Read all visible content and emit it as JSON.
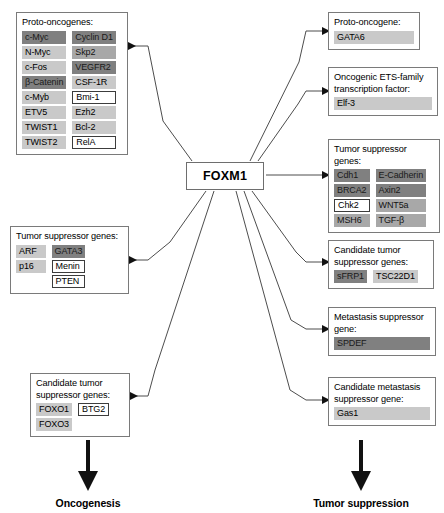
{
  "center": {
    "label": "FOXM1"
  },
  "left_panels": [
    {
      "id": "proto-oncogenes",
      "title": "Proto-oncogenes:",
      "columns": [
        [
          {
            "label": "c-Myc",
            "shade": "dark"
          },
          {
            "label": "N-Myc",
            "shade": "light"
          },
          {
            "label": "c-Fos",
            "shade": "light"
          },
          {
            "label": "β-Catenin",
            "shade": "dark"
          },
          {
            "label": "c-Myb",
            "shade": "light"
          },
          {
            "label": "ETV5",
            "shade": "light"
          },
          {
            "label": "TWIST1",
            "shade": "light"
          },
          {
            "label": "TWIST2",
            "shade": "light"
          }
        ],
        [
          {
            "label": "Cyclin D1",
            "shade": "dark"
          },
          {
            "label": "Skp2",
            "shade": "mid"
          },
          {
            "label": "VEGFR2",
            "shade": "dark"
          },
          {
            "label": "CSF-1R",
            "shade": "light"
          },
          {
            "label": "Bmi-1",
            "shade": "box"
          },
          {
            "label": "Ezh2",
            "shade": "light"
          },
          {
            "label": "Bcl-2",
            "shade": "light"
          },
          {
            "label": "RelA",
            "shade": "box"
          }
        ]
      ]
    },
    {
      "id": "tumor-suppressor-genes-left",
      "title": "Tumor suppressor genes:",
      "columns": [
        [
          {
            "label": "ARF",
            "shade": "light"
          },
          {
            "label": "p16",
            "shade": "light"
          },
          {
            "label": "",
            "shade": "spacer"
          }
        ],
        [
          {
            "label": "GATA3",
            "shade": "dark"
          },
          {
            "label": "Menin",
            "shade": "box"
          },
          {
            "label": "PTEN",
            "shade": "box"
          }
        ]
      ]
    },
    {
      "id": "candidate-tumor-suppressor-genes",
      "title": "Candidate tumor\nsuppressor genes:",
      "columns": [
        [
          {
            "label": "FOXO1",
            "shade": "light"
          },
          {
            "label": "FOXO3",
            "shade": "light"
          }
        ],
        [
          {
            "label": "BTG2",
            "shade": "box"
          }
        ]
      ]
    }
  ],
  "right_panels": [
    {
      "id": "proto-oncogene",
      "title": "Proto-oncogene:",
      "columns": [
        [
          {
            "label": "GATA6",
            "shade": "light"
          }
        ]
      ]
    },
    {
      "id": "oncogenic-ets-family-transcription-factor",
      "title": "Oncogenic ETS-family\ntranscription factor:",
      "columns": [
        [
          {
            "label": "Elf-3",
            "shade": "light"
          }
        ]
      ]
    },
    {
      "id": "tumor-suppressor-genes-right",
      "title": "Tumor suppressor genes:",
      "columns": [
        [
          {
            "label": "Cdh1",
            "shade": "dark"
          },
          {
            "label": "BRCA2",
            "shade": "dark"
          },
          {
            "label": "Chk2",
            "shade": "box"
          },
          {
            "label": "MSH6",
            "shade": "mid"
          }
        ],
        [
          {
            "label": "E-Cadherin",
            "shade": "dark"
          },
          {
            "label": "Axin2",
            "shade": "dark"
          },
          {
            "label": "WNT5a",
            "shade": "mid"
          },
          {
            "label": "TGF-β",
            "shade": "mid"
          }
        ]
      ]
    },
    {
      "id": "candidate-tumor-suppressor-genes-right",
      "title": "Candidate tumor\nsuppressor genes:",
      "columns": [
        [
          {
            "label": "sFRP1",
            "shade": "dark"
          }
        ],
        [
          {
            "label": "TSC22D1",
            "shade": "light"
          }
        ]
      ]
    },
    {
      "id": "metastasis-suppressor-gene",
      "title": "Metastasis suppressor\ngene:",
      "columns": [
        [
          {
            "label": "SPDEF",
            "shade": "dark"
          }
        ]
      ]
    },
    {
      "id": "candidate-metastasis-suppressor-gene",
      "title": "Candidate metastasis\nsuppressor gene:",
      "columns": [
        [
          {
            "label": "Gas1",
            "shade": "light"
          }
        ]
      ]
    }
  ],
  "outcomes": {
    "left": "Oncogenesis",
    "right": "Tumor suppression"
  },
  "colors": {
    "dark": "#808080",
    "mid": "#a8a8a8",
    "light": "#c9c9c9",
    "outline": "#3c3c3c",
    "panel_border": "#7a7a7a",
    "line": "#4d4d4d",
    "arrow_thick": "#111111"
  }
}
